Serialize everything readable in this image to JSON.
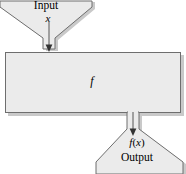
{
  "diagram": {
    "type": "function-machine",
    "colors": {
      "fill": "#ebebeb",
      "stroke": "#6e6e6e",
      "shadow": "#c9c9c9",
      "text": "#000000",
      "background": "#ffffff"
    },
    "labels": {
      "input": "Input",
      "input_variable": "x",
      "function": "f",
      "output_value_prefix": "f",
      "output_value_paren_open": "(",
      "output_value_variable": "x",
      "output_value_paren_close": ")",
      "output": "Output"
    },
    "arrows": [
      {
        "name": "input-arrow",
        "direction": "down",
        "from": "input-hopper",
        "to": "function-box"
      },
      {
        "name": "output-arrow",
        "direction": "down",
        "from": "function-box",
        "to": "output-hopper"
      }
    ],
    "shapes": [
      {
        "name": "input-hopper",
        "role": "funnel-narrowing-downward"
      },
      {
        "name": "input-neck",
        "role": "channel"
      },
      {
        "name": "function-box",
        "role": "rectangle"
      },
      {
        "name": "output-neck",
        "role": "channel"
      },
      {
        "name": "output-hopper",
        "role": "funnel-widening-downward"
      }
    ]
  }
}
